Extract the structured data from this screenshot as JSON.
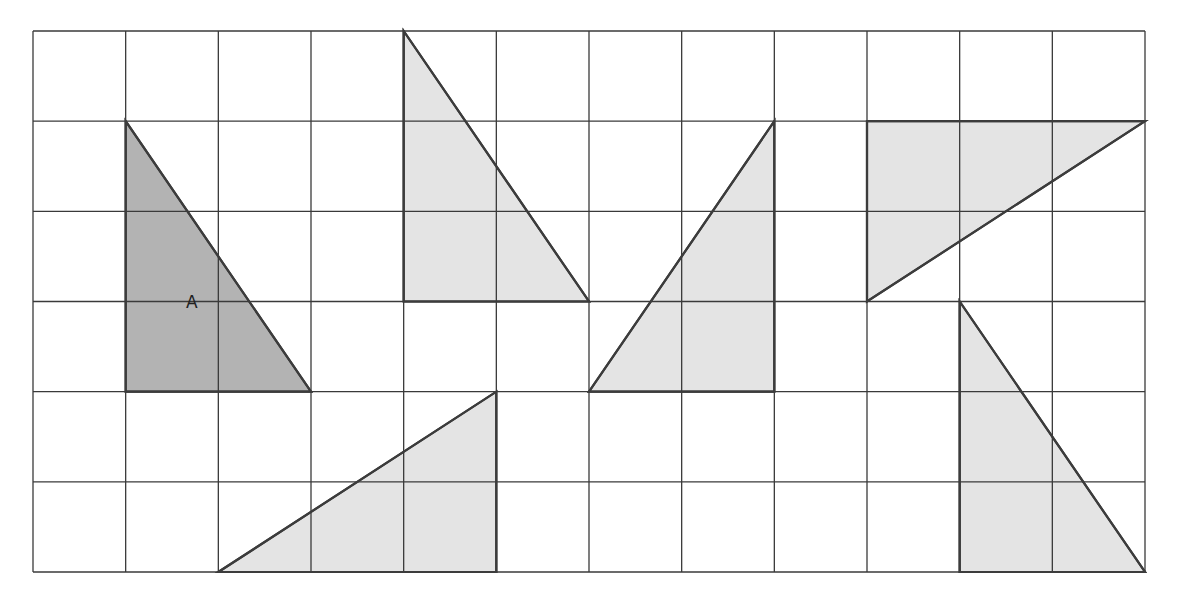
{
  "diagram": {
    "grid": {
      "columns": 12,
      "rows": 6
    },
    "colors": {
      "grid_line": "#3a3a3a",
      "outline": "#3c3c3c",
      "shape_A_fill": "#b3b3b3",
      "shape_fill": "#e4e4e4",
      "background": "#ffffff"
    },
    "triangles": [
      {
        "id": "A",
        "label": "A",
        "highlighted": true,
        "vertices": [
          [
            1,
            1
          ],
          [
            1,
            4
          ],
          [
            3,
            4
          ]
        ]
      },
      {
        "id": "T1",
        "label": "",
        "highlighted": false,
        "vertices": [
          [
            4,
            0
          ],
          [
            4,
            3
          ],
          [
            6,
            3
          ]
        ]
      },
      {
        "id": "T2",
        "label": "",
        "highlighted": false,
        "vertices": [
          [
            6,
            4
          ],
          [
            8,
            4
          ],
          [
            8,
            1
          ]
        ]
      },
      {
        "id": "T3",
        "label": "",
        "highlighted": false,
        "vertices": [
          [
            9,
            1
          ],
          [
            12,
            1
          ],
          [
            9,
            3
          ]
        ]
      },
      {
        "id": "T4",
        "label": "",
        "highlighted": false,
        "vertices": [
          [
            2,
            6
          ],
          [
            5,
            6
          ],
          [
            5,
            4
          ]
        ]
      },
      {
        "id": "T5",
        "label": "",
        "highlighted": false,
        "vertices": [
          [
            10,
            3
          ],
          [
            10,
            6
          ],
          [
            12,
            6
          ]
        ]
      }
    ]
  }
}
